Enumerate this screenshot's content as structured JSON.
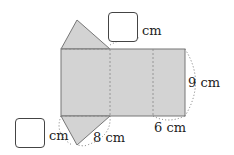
{
  "diagram": {
    "fill_color": "#d3d3d3",
    "labels": {
      "top_unit": "cm",
      "right_height": "9 cm",
      "bottom_width": "6 cm",
      "slant": "8 cm",
      "left_unit": "cm"
    },
    "answer_boxes": [
      {
        "id": "top",
        "value": ""
      },
      {
        "id": "bottom-left",
        "value": ""
      }
    ]
  }
}
